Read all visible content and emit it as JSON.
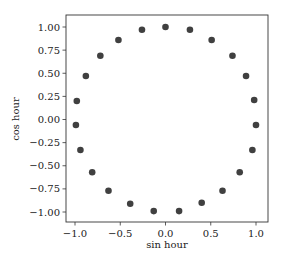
{
  "chart_data": {
    "type": "scatter",
    "title": "",
    "xlabel": "sin hour",
    "ylabel": "cos hour",
    "xlim": [
      -1.1,
      1.1
    ],
    "ylim": [
      -1.1,
      1.1
    ],
    "grid": false,
    "legend": null,
    "marker_color": "#404040",
    "x_ticks": [
      -1.0,
      -0.5,
      0.0,
      0.5,
      1.0
    ],
    "x_tick_labels": [
      "−1.0",
      "−0.5",
      "0.0",
      "0.5",
      "1.0"
    ],
    "y_ticks": [
      1.0,
      0.75,
      0.5,
      0.25,
      0.0,
      -0.25,
      -0.5,
      -0.75,
      -1.0
    ],
    "y_tick_labels": [
      "1.00",
      "0.75",
      "0.50",
      "0.25",
      "0.00",
      "−0.25",
      "−0.50",
      "−0.75",
      "−1.00"
    ],
    "series": [
      {
        "name": "hour",
        "x": [
          0.0,
          0.27,
          0.51,
          0.74,
          0.89,
          0.98,
          1.0,
          0.96,
          0.82,
          0.63,
          0.4,
          0.15,
          -0.13,
          -0.39,
          -0.63,
          -0.81,
          -0.94,
          -0.99,
          -0.98,
          -0.88,
          -0.72,
          -0.52,
          -0.26
        ],
        "y": [
          1.0,
          0.97,
          0.86,
          0.69,
          0.47,
          0.21,
          -0.06,
          -0.33,
          -0.57,
          -0.77,
          -0.9,
          -0.99,
          -0.99,
          -0.91,
          -0.77,
          -0.57,
          -0.33,
          -0.06,
          0.2,
          0.47,
          0.69,
          0.86,
          0.97
        ]
      }
    ]
  }
}
